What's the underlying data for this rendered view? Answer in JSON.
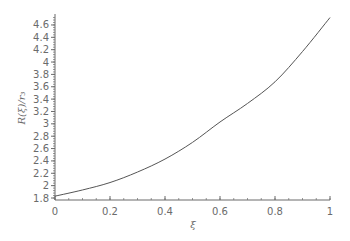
{
  "chart_data": {
    "type": "line",
    "title": "",
    "xlabel": "ξ",
    "ylabel": "R(ξ)/r₃",
    "xlim": [
      0,
      1
    ],
    "ylim": [
      1.8,
      4.75
    ],
    "x_ticks": [
      "0",
      "0.2",
      "0.4",
      "0.6",
      "0.8",
      "1"
    ],
    "y_ticks": [
      "1.8",
      "2",
      "2.2",
      "2.4",
      "2.6",
      "2.8",
      "3",
      "3.2",
      "3.4",
      "3.6",
      "3.8",
      "4",
      "4.2",
      "4.4",
      "4.6"
    ],
    "grid": false,
    "legend": null,
    "series": [
      {
        "name": "R(ξ)/r₃",
        "color": "#555555",
        "x": [
          0,
          0.1,
          0.2,
          0.3,
          0.4,
          0.5,
          0.6,
          0.7,
          0.8,
          0.9,
          1.0
        ],
        "y": [
          1.83,
          1.93,
          2.05,
          2.22,
          2.43,
          2.7,
          3.03,
          3.33,
          3.68,
          4.17,
          4.72
        ]
      }
    ]
  },
  "labels": {
    "xlabel": "ξ",
    "ylabel": "R(ξ)/r₃"
  }
}
